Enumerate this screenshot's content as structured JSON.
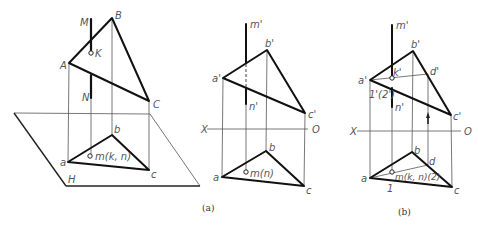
{
  "figure": {
    "panel_a_caption": "(a)",
    "panel_b_caption": "(b)",
    "spatial": {
      "labels": {
        "M": "M",
        "B": "B",
        "K": "K",
        "A": "A",
        "N": "N",
        "C": "C",
        "b": "b",
        "a": "a",
        "c": "c",
        "m": "m(k, n)",
        "H": "H"
      }
    },
    "projection_a": {
      "labels": {
        "m_prime": "m'",
        "b_prime": "b'",
        "a_prime": "a'",
        "n_prime": "n'",
        "c_prime": "c'",
        "X": "X",
        "O": "O",
        "b": "b",
        "a": "a",
        "c": "c",
        "m": "m(n)"
      }
    },
    "projection_b": {
      "labels": {
        "m_prime": "m'",
        "b_prime": "b'",
        "k_prime": "k'",
        "d_prime": "d'",
        "a_prime": "a'",
        "one_two_prime": "1'(2')",
        "n_prime": "n'",
        "c_prime": "c'",
        "X": "X",
        "O": "O",
        "b": "b",
        "d": "d",
        "a": "a",
        "c": "c",
        "m": "m(k, n)(2)",
        "one": "1"
      }
    }
  }
}
